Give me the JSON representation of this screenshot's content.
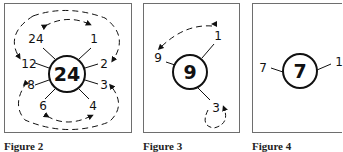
{
  "panels": [
    {
      "id": "p1",
      "center": "24",
      "factors": [
        "24",
        "1",
        "2",
        "3",
        "4",
        "6",
        "8",
        "12"
      ],
      "pairs": [
        [
          "1",
          "24"
        ],
        [
          "2",
          "12"
        ],
        [
          "3",
          "8"
        ],
        [
          "4",
          "6"
        ]
      ],
      "caption": "Figure 2"
    },
    {
      "id": "p2",
      "center": "9",
      "factors": [
        "1",
        "9",
        "3"
      ],
      "pairs": [
        [
          "1",
          "9"
        ],
        [
          "3",
          "3"
        ]
      ],
      "caption": "Figure 3"
    },
    {
      "id": "p3",
      "center": "7",
      "factors": [
        "7",
        "1"
      ],
      "pairs": [
        [
          "1",
          "7"
        ]
      ],
      "caption": "Figure 4"
    }
  ],
  "colors": {
    "line": "#111111",
    "frame": "#6e6e6e"
  }
}
